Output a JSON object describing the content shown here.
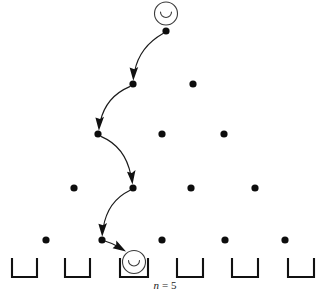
{
  "figure": {
    "caption": "n = 5",
    "caption_variable": "n",
    "caption_equals": "=",
    "caption_value": "5",
    "background_color": "#ffffff",
    "ink_color": "#111111",
    "ball_outline_color": "#3a3a3a"
  },
  "ball_top": {
    "label": "ball-start",
    "cx": 166,
    "cy": 13.5,
    "r": 11.5,
    "glyph": "smile-arc"
  },
  "ball_bottom": {
    "label": "ball-landed",
    "cx": 134,
    "cy": 262,
    "r": 11.5,
    "glyph": "smile-arc"
  },
  "pegs": {
    "rows": [
      {
        "row": 1,
        "y": 31,
        "xs": [
          166
        ]
      },
      {
        "row": 2,
        "y": 84,
        "xs": [
          133,
          193
        ]
      },
      {
        "row": 3,
        "y": 134,
        "xs": [
          98,
          162,
          224
        ]
      },
      {
        "row": 4,
        "y": 188,
        "xs": [
          74,
          133,
          191,
          255
        ]
      },
      {
        "row": 5,
        "y": 240,
        "xs": [
          46,
          102,
          162,
          225,
          285
        ]
      }
    ],
    "radius": 3.6,
    "count": 15
  },
  "path": {
    "description": "ball bounces left, left, right, left then drops into bin 3",
    "moves": [
      "left",
      "left",
      "right",
      "left",
      "drop"
    ],
    "nodes": [
      {
        "x": 166,
        "y": 31
      },
      {
        "x": 133,
        "y": 84
      },
      {
        "x": 98,
        "y": 134
      },
      {
        "x": 133,
        "y": 188
      },
      {
        "x": 102,
        "y": 240
      },
      {
        "x": 134,
        "y": 256
      }
    ]
  },
  "bins": {
    "count": 6,
    "top_y": 258,
    "bottom_y": 277,
    "items": [
      {
        "index": 1,
        "left": 12,
        "right": 37
      },
      {
        "index": 2,
        "left": 65,
        "right": 90
      },
      {
        "index": 3,
        "left": 120,
        "right": 148
      },
      {
        "index": 4,
        "left": 177,
        "right": 203
      },
      {
        "index": 5,
        "left": 232,
        "right": 258
      },
      {
        "index": 6,
        "left": 288,
        "right": 314
      }
    ]
  }
}
